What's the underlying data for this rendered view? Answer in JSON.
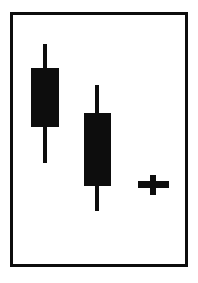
{
  "figure": {
    "width": 198,
    "height": 283,
    "background_color": "#ffffff",
    "ink_color": "#0d0d0d",
    "frame": {
      "name": "chart-frame",
      "x": 10,
      "y": 12,
      "width": 178,
      "height": 255,
      "border_width": 3,
      "border_color": "#0d0d0d"
    }
  },
  "chart_data": {
    "type": "candlestick",
    "title": "",
    "subtitle": "",
    "xlabel": "",
    "ylabel": "",
    "grid": false,
    "legend": "none",
    "axis_labels_visible": false,
    "tick_labels_visible": false,
    "pattern_name": "Three Black Crows",
    "orientation": "downtrend",
    "y_axis_orientation": "price-increases-upward",
    "categories": [
      "1",
      "2",
      "3"
    ],
    "series": [
      {
        "name": "candles",
        "points": [
          {
            "index": 1,
            "label": "candle-1",
            "direction": "bearish",
            "fill": "filled",
            "open_px": 68,
            "close_px": 127,
            "high_px": 44,
            "low_px": 163,
            "center_x_px": 45,
            "body_left_px": 31,
            "body_right_px": 59,
            "body_width_px": 28,
            "wick_width_px": 4
          },
          {
            "index": 2,
            "label": "candle-2",
            "direction": "bearish",
            "fill": "filled",
            "open_px": 113,
            "close_px": 186,
            "high_px": 85,
            "low_px": 211,
            "center_x_px": 97,
            "body_left_px": 84,
            "body_right_px": 111,
            "body_width_px": 27,
            "wick_width_px": 4
          },
          {
            "index": 3,
            "label": "candle-3-doji",
            "direction": "doji",
            "fill": "filled",
            "open_px": 181,
            "close_px": 188,
            "high_px": 175,
            "low_px": 195,
            "center_x_px": 153,
            "body_left_px": 138,
            "body_right_px": 169,
            "body_width_px": 31,
            "wick_width_px": 6
          }
        ]
      }
    ]
  }
}
